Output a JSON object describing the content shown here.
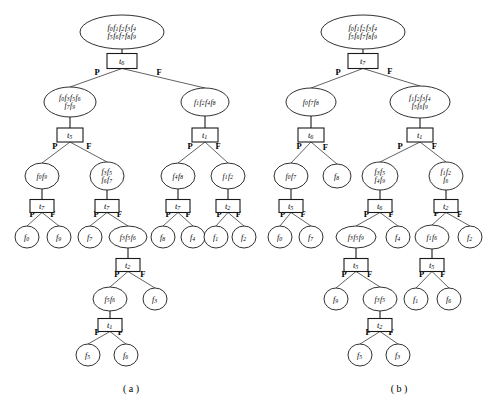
{
  "figure": {
    "background": "#ffffff",
    "ink": "#1a1a1a",
    "width": 494,
    "height": 406,
    "captions": [
      {
        "name": "caption-a",
        "text": "( a )",
        "x": 131,
        "y": 392
      },
      {
        "name": "caption-b",
        "text": "( b )",
        "x": 399,
        "y": 392
      }
    ],
    "branch_labels": {
      "left": "P",
      "right": "F"
    }
  },
  "panels": [
    {
      "id": "a",
      "caption": "( a )",
      "root_test": "t6",
      "nodes": [
        {
          "id": "a-n0",
          "kind": "ellipse",
          "label": "f0 f1 f2 f3 f4|f5 f6 f7 f8 f9",
          "x": 122,
          "y": 32,
          "rx": 42,
          "ry": 17
        },
        {
          "id": "a-t0",
          "kind": "box",
          "label": "t6",
          "x": 122,
          "y": 61,
          "w": 30,
          "h": 15
        },
        {
          "id": "a-n1",
          "kind": "ellipse",
          "label": "f0 f3 f5 f6|f7 f9",
          "x": 70,
          "y": 102,
          "rx": 26,
          "ry": 15
        },
        {
          "id": "a-t1",
          "kind": "box",
          "label": "t5",
          "x": 70,
          "y": 135,
          "w": 26,
          "h": 14
        },
        {
          "id": "a-n2",
          "kind": "ellipse",
          "label": "f1 f2 f4 f8",
          "x": 205,
          "y": 102,
          "rx": 24,
          "ry": 14
        },
        {
          "id": "a-t2",
          "kind": "box",
          "label": "t1",
          "x": 205,
          "y": 135,
          "w": 26,
          "h": 14
        },
        {
          "id": "a-n3",
          "kind": "ellipse",
          "label": "f0 f9",
          "x": 42,
          "y": 176,
          "rx": 17,
          "ry": 13
        },
        {
          "id": "a-t3",
          "kind": "box",
          "label": "t7",
          "x": 42,
          "y": 206,
          "w": 24,
          "h": 13
        },
        {
          "id": "a-n4",
          "kind": "ellipse",
          "label": "f3 f5|f6 f7",
          "x": 107,
          "y": 176,
          "rx": 17,
          "ry": 14
        },
        {
          "id": "a-t4",
          "kind": "box",
          "label": "t7",
          "x": 107,
          "y": 206,
          "w": 24,
          "h": 13
        },
        {
          "id": "a-n5",
          "kind": "ellipse",
          "label": "f4 f8",
          "x": 178,
          "y": 176,
          "rx": 17,
          "ry": 13
        },
        {
          "id": "a-t5",
          "kind": "box",
          "label": "t7",
          "x": 178,
          "y": 206,
          "w": 24,
          "h": 13
        },
        {
          "id": "a-n6",
          "kind": "ellipse",
          "label": "f1 f2",
          "x": 228,
          "y": 176,
          "rx": 17,
          "ry": 13
        },
        {
          "id": "a-t6",
          "kind": "box",
          "label": "t2",
          "x": 228,
          "y": 206,
          "w": 24,
          "h": 13
        },
        {
          "id": "a-l0",
          "kind": "ellipse",
          "label": "f0",
          "x": 27,
          "y": 237,
          "rx": 12,
          "ry": 11
        },
        {
          "id": "a-l1",
          "kind": "ellipse",
          "label": "f9",
          "x": 59,
          "y": 237,
          "rx": 12,
          "ry": 11
        },
        {
          "id": "a-l2",
          "kind": "ellipse",
          "label": "f7",
          "x": 90,
          "y": 237,
          "rx": 12,
          "ry": 11
        },
        {
          "id": "a-n7",
          "kind": "ellipse",
          "label": "f3 f5 f6",
          "x": 128,
          "y": 237,
          "rx": 19,
          "ry": 11
        },
        {
          "id": "a-l3",
          "kind": "ellipse",
          "label": "f8",
          "x": 163,
          "y": 237,
          "rx": 12,
          "ry": 11
        },
        {
          "id": "a-l4",
          "kind": "ellipse",
          "label": "f4",
          "x": 193,
          "y": 237,
          "rx": 12,
          "ry": 11
        },
        {
          "id": "a-l5",
          "kind": "ellipse",
          "label": "f1",
          "x": 216,
          "y": 237,
          "rx": 12,
          "ry": 11
        },
        {
          "id": "a-l6",
          "kind": "ellipse",
          "label": "f2",
          "x": 244,
          "y": 237,
          "rx": 12,
          "ry": 11
        },
        {
          "id": "a-t7",
          "kind": "box",
          "label": "t2",
          "x": 128,
          "y": 265,
          "w": 24,
          "h": 13
        },
        {
          "id": "a-n8",
          "kind": "ellipse",
          "label": "f5 f6",
          "x": 110,
          "y": 299,
          "rx": 17,
          "ry": 12
        },
        {
          "id": "a-l7",
          "kind": "ellipse",
          "label": "f3",
          "x": 155,
          "y": 299,
          "rx": 12,
          "ry": 11
        },
        {
          "id": "a-t8",
          "kind": "box",
          "label": "t1",
          "x": 110,
          "y": 325,
          "w": 24,
          "h": 13
        },
        {
          "id": "a-l8",
          "kind": "ellipse",
          "label": "f5",
          "x": 88,
          "y": 355,
          "rx": 12,
          "ry": 11
        },
        {
          "id": "a-l9",
          "kind": "ellipse",
          "label": "f6",
          "x": 126,
          "y": 355,
          "rx": 12,
          "ry": 11
        }
      ],
      "stems": [
        {
          "from": "a-n0",
          "to": "a-t0"
        },
        {
          "from": "a-n1",
          "to": "a-t1"
        },
        {
          "from": "a-n2",
          "to": "a-t2"
        },
        {
          "from": "a-n3",
          "to": "a-t3"
        },
        {
          "from": "a-n4",
          "to": "a-t4"
        },
        {
          "from": "a-n5",
          "to": "a-t5"
        },
        {
          "from": "a-n6",
          "to": "a-t6"
        },
        {
          "from": "a-n7",
          "to": "a-t7"
        },
        {
          "from": "a-n8",
          "to": "a-t8"
        }
      ],
      "edges": [
        {
          "from": "a-t0",
          "to": "a-n1",
          "label": "P"
        },
        {
          "from": "a-t0",
          "to": "a-n2",
          "label": "F"
        },
        {
          "from": "a-t1",
          "to": "a-n3",
          "label": "P"
        },
        {
          "from": "a-t1",
          "to": "a-n4",
          "label": "F"
        },
        {
          "from": "a-t2",
          "to": "a-n5",
          "label": "P"
        },
        {
          "from": "a-t2",
          "to": "a-n6",
          "label": "F"
        },
        {
          "from": "a-t3",
          "to": "a-l0",
          "label": "P"
        },
        {
          "from": "a-t3",
          "to": "a-l1",
          "label": "F"
        },
        {
          "from": "a-t4",
          "to": "a-l2",
          "label": "P"
        },
        {
          "from": "a-t4",
          "to": "a-n7",
          "label": "F"
        },
        {
          "from": "a-t5",
          "to": "a-l3",
          "label": "P"
        },
        {
          "from": "a-t5",
          "to": "a-l4",
          "label": "F"
        },
        {
          "from": "a-t6",
          "to": "a-l5",
          "label": "P"
        },
        {
          "from": "a-t6",
          "to": "a-l6",
          "label": "F"
        },
        {
          "from": "a-t7",
          "to": "a-n8",
          "label": "P"
        },
        {
          "from": "a-t7",
          "to": "a-l7",
          "label": "F"
        },
        {
          "from": "a-t8",
          "to": "a-l8",
          "label": "P"
        },
        {
          "from": "a-t8",
          "to": "a-l9",
          "label": "F"
        }
      ]
    },
    {
      "id": "b",
      "caption": "( b )",
      "root_test": "t7",
      "nodes": [
        {
          "id": "b-n0",
          "kind": "ellipse",
          "label": "f0 f1 f2 f3 f4|f5 f6 f7 f8 f9",
          "x": 363,
          "y": 32,
          "rx": 42,
          "ry": 17
        },
        {
          "id": "b-t0",
          "kind": "box",
          "label": "t7",
          "x": 363,
          "y": 61,
          "w": 30,
          "h": 15
        },
        {
          "id": "b-n1",
          "kind": "ellipse",
          "label": "f0 f7 f8",
          "x": 311,
          "y": 102,
          "rx": 25,
          "ry": 14
        },
        {
          "id": "b-t1",
          "kind": "box",
          "label": "t6",
          "x": 311,
          "y": 135,
          "w": 26,
          "h": 14
        },
        {
          "id": "b-n2",
          "kind": "ellipse",
          "label": "f1 f2 f3 f4|f5 f6 f9",
          "x": 420,
          "y": 102,
          "rx": 30,
          "ry": 16
        },
        {
          "id": "b-t2",
          "kind": "box",
          "label": "t1",
          "x": 420,
          "y": 135,
          "w": 26,
          "h": 14
        },
        {
          "id": "b-n3",
          "kind": "ellipse",
          "label": "f0 f7",
          "x": 291,
          "y": 176,
          "rx": 17,
          "ry": 13
        },
        {
          "id": "b-t3",
          "kind": "box",
          "label": "t5",
          "x": 291,
          "y": 206,
          "w": 24,
          "h": 13
        },
        {
          "id": "b-l0",
          "kind": "ellipse",
          "label": "f8",
          "x": 337,
          "y": 176,
          "rx": 14,
          "ry": 12
        },
        {
          "id": "b-n4",
          "kind": "ellipse",
          "label": "f3 f5|f4 f9",
          "x": 380,
          "y": 176,
          "rx": 18,
          "ry": 14
        },
        {
          "id": "b-t4",
          "kind": "box",
          "label": "t6",
          "x": 380,
          "y": 206,
          "w": 24,
          "h": 13
        },
        {
          "id": "b-n5",
          "kind": "ellipse",
          "label": "f1 f2|f6",
          "x": 446,
          "y": 176,
          "rx": 17,
          "ry": 14
        },
        {
          "id": "b-t5",
          "kind": "box",
          "label": "t2",
          "x": 446,
          "y": 206,
          "w": 24,
          "h": 13
        },
        {
          "id": "b-l1",
          "kind": "ellipse",
          "label": "f0",
          "x": 280,
          "y": 237,
          "rx": 12,
          "ry": 11
        },
        {
          "id": "b-l2",
          "kind": "ellipse",
          "label": "f7",
          "x": 311,
          "y": 237,
          "rx": 12,
          "ry": 11
        },
        {
          "id": "b-n6",
          "kind": "ellipse",
          "label": "f3 f5 f9",
          "x": 356,
          "y": 237,
          "rx": 20,
          "ry": 11
        },
        {
          "id": "b-l3",
          "kind": "ellipse",
          "label": "f4",
          "x": 398,
          "y": 237,
          "rx": 12,
          "ry": 11
        },
        {
          "id": "b-n7",
          "kind": "ellipse",
          "label": "f1 f6",
          "x": 432,
          "y": 237,
          "rx": 17,
          "ry": 12
        },
        {
          "id": "b-l4",
          "kind": "ellipse",
          "label": "f2",
          "x": 470,
          "y": 237,
          "rx": 12,
          "ry": 11
        },
        {
          "id": "b-t6",
          "kind": "box",
          "label": "t5",
          "x": 356,
          "y": 265,
          "w": 24,
          "h": 13
        },
        {
          "id": "b-t7",
          "kind": "box",
          "label": "t5",
          "x": 432,
          "y": 265,
          "w": 24,
          "h": 13
        },
        {
          "id": "b-l5",
          "kind": "ellipse",
          "label": "f9",
          "x": 336,
          "y": 299,
          "rx": 12,
          "ry": 11
        },
        {
          "id": "b-n8",
          "kind": "ellipse",
          "label": "f3 f5",
          "x": 380,
          "y": 299,
          "rx": 17,
          "ry": 12
        },
        {
          "id": "b-l6",
          "kind": "ellipse",
          "label": "f1",
          "x": 416,
          "y": 299,
          "rx": 12,
          "ry": 11
        },
        {
          "id": "b-l7",
          "kind": "ellipse",
          "label": "f6",
          "x": 449,
          "y": 299,
          "rx": 12,
          "ry": 11
        },
        {
          "id": "b-t8",
          "kind": "box",
          "label": "t2",
          "x": 380,
          "y": 325,
          "w": 24,
          "h": 13
        },
        {
          "id": "b-l8",
          "kind": "ellipse",
          "label": "f5",
          "x": 360,
          "y": 355,
          "rx": 12,
          "ry": 11
        },
        {
          "id": "b-l9",
          "kind": "ellipse",
          "label": "f3",
          "x": 398,
          "y": 355,
          "rx": 12,
          "ry": 11
        }
      ],
      "stems": [
        {
          "from": "b-n0",
          "to": "b-t0"
        },
        {
          "from": "b-n1",
          "to": "b-t1"
        },
        {
          "from": "b-n2",
          "to": "b-t2"
        },
        {
          "from": "b-n3",
          "to": "b-t3"
        },
        {
          "from": "b-n4",
          "to": "b-t4"
        },
        {
          "from": "b-n5",
          "to": "b-t5"
        },
        {
          "from": "b-n6",
          "to": "b-t6"
        },
        {
          "from": "b-n7",
          "to": "b-t7"
        },
        {
          "from": "b-n8",
          "to": "b-t8"
        }
      ],
      "edges": [
        {
          "from": "b-t0",
          "to": "b-n1",
          "label": "P"
        },
        {
          "from": "b-t0",
          "to": "b-n2",
          "label": "F"
        },
        {
          "from": "b-t1",
          "to": "b-n3",
          "label": "P"
        },
        {
          "from": "b-t1",
          "to": "b-l0",
          "label": "F"
        },
        {
          "from": "b-t2",
          "to": "b-n4",
          "label": "P"
        },
        {
          "from": "b-t2",
          "to": "b-n5",
          "label": "F"
        },
        {
          "from": "b-t3",
          "to": "b-l1",
          "label": "P"
        },
        {
          "from": "b-t3",
          "to": "b-l2",
          "label": "F"
        },
        {
          "from": "b-t4",
          "to": "b-n6",
          "label": "P"
        },
        {
          "from": "b-t4",
          "to": "b-l3",
          "label": "F"
        },
        {
          "from": "b-t5",
          "to": "b-n7",
          "label": "P"
        },
        {
          "from": "b-t5",
          "to": "b-l4",
          "label": "F"
        },
        {
          "from": "b-t6",
          "to": "b-l5",
          "label": "P"
        },
        {
          "from": "b-t6",
          "to": "b-n8",
          "label": "F"
        },
        {
          "from": "b-t7",
          "to": "b-l6",
          "label": "P"
        },
        {
          "from": "b-t7",
          "to": "b-l7",
          "label": "F"
        },
        {
          "from": "b-t8",
          "to": "b-l8",
          "label": "P"
        },
        {
          "from": "b-t8",
          "to": "b-l9",
          "label": "F"
        }
      ]
    }
  ]
}
